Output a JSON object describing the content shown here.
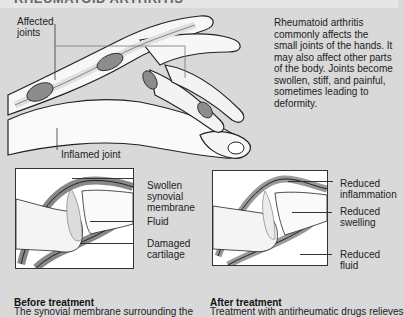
{
  "header": {
    "cut_off_title": "RHEUMATOID ARTHRITIS"
  },
  "hand_illustration": {
    "label_affected_joints": "Affected joints",
    "label_inflamed_joint": "Inflamed joint"
  },
  "description": "Rheumatoid arthritis commonly affects the small joints of the hands. It may also affect other parts of the body. Joints become swollen, stiff, and painful, sometimes leading to deformity.",
  "before_panel": {
    "labels": [
      "Swollen synovial membrane",
      "Fluid",
      "Damaged cartilage"
    ],
    "caption_title": "Before treatment",
    "caption_text": "The synovial membrane surrounding the"
  },
  "after_panel": {
    "labels": [
      "Reduced inflammation",
      "Reduced swelling",
      "Reduced fluid"
    ],
    "caption_title": "After treatment",
    "caption_text": "Treatment with antirheumatic drugs relieves"
  },
  "colors": {
    "background": "#d9d9d9",
    "membrane": "#8c8c8c",
    "bone": "#f2f2f2",
    "outline": "#222222"
  }
}
